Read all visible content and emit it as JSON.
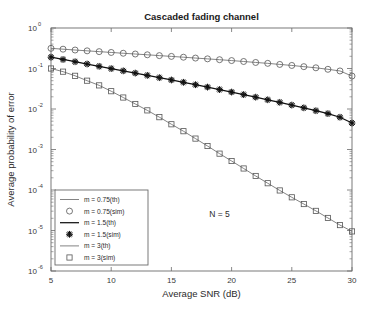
{
  "chart_data": {
    "type": "line",
    "title": "Cascaded fading channel",
    "xlabel": "Average SNR (dB)",
    "ylabel": "Average probability of error",
    "yscale": "log",
    "xlim": [
      5,
      30
    ],
    "ylim": [
      1e-06,
      1
    ],
    "xticks": [
      5,
      10,
      15,
      20,
      25,
      30
    ],
    "xticklabels": [
      "5",
      "10",
      "15",
      "20",
      "25",
      "30"
    ],
    "yticks": [
      1,
      0.1,
      0.01,
      0.001,
      0.0001,
      1e-05,
      1e-06
    ],
    "yticklabels": [
      "10",
      "10",
      "10",
      "10",
      "10",
      "10",
      "10"
    ],
    "yticksuperscripts": [
      "0",
      "-1",
      "-2",
      "-3",
      "-4",
      "-5",
      "-6"
    ],
    "grid": false,
    "legend_position": "lower-left",
    "annotations": [
      {
        "text": "N = 5",
        "x": 19.0,
        "y": 2.2e-05
      }
    ],
    "x": [
      5,
      6,
      7,
      8,
      9,
      10,
      11,
      12,
      13,
      14,
      15,
      16,
      17,
      18,
      19,
      20,
      21,
      22,
      23,
      24,
      25,
      26,
      27,
      28,
      29,
      30
    ],
    "series": [
      {
        "name": "m = 0.75(th)",
        "style": "line",
        "marker": "none",
        "color": "#6e6e6e",
        "values": [
          0.315,
          0.3,
          0.286,
          0.273,
          0.261,
          0.249,
          0.238,
          0.228,
          0.218,
          0.208,
          0.199,
          0.19,
          0.181,
          0.173,
          0.165,
          0.157,
          0.149,
          0.141,
          0.134,
          0.126,
          0.119,
          0.111,
          0.104,
          0.0955,
          0.087,
          0.065
        ]
      },
      {
        "name": "m = 0.75(sim)",
        "style": "marker",
        "marker": "circle",
        "color": "#555555",
        "values": [
          0.315,
          0.3,
          0.286,
          0.273,
          0.261,
          0.249,
          0.238,
          0.228,
          0.218,
          0.208,
          0.199,
          0.19,
          0.181,
          0.173,
          0.165,
          0.157,
          0.149,
          0.141,
          0.134,
          0.126,
          0.119,
          0.111,
          0.104,
          0.0955,
          0.087,
          0.065
        ]
      },
      {
        "name": "m = 1.5(th)",
        "style": "line",
        "marker": "none",
        "color": "#111111",
        "values": [
          0.19,
          0.167,
          0.147,
          0.129,
          0.113,
          0.0995,
          0.0875,
          0.077,
          0.0676,
          0.0594,
          0.0521,
          0.0456,
          0.0398,
          0.0347,
          0.0302,
          0.0262,
          0.0227,
          0.0196,
          0.0169,
          0.0146,
          0.0125,
          0.0107,
          0.00908,
          0.0077,
          0.00626,
          0.0045
        ]
      },
      {
        "name": "m = 1.5(sim)",
        "style": "marker",
        "marker": "star",
        "color": "#111111",
        "values": [
          0.19,
          0.167,
          0.147,
          0.129,
          0.113,
          0.0995,
          0.0875,
          0.077,
          0.0676,
          0.0594,
          0.0521,
          0.0456,
          0.0398,
          0.0347,
          0.0302,
          0.0262,
          0.0227,
          0.0196,
          0.0169,
          0.0146,
          0.0125,
          0.0107,
          0.00908,
          0.0077,
          0.00626,
          0.0045
        ]
      },
      {
        "name": "m = 3(th)",
        "style": "line",
        "marker": "none",
        "color": "#6e6e6e",
        "values": [
          0.1,
          0.0835,
          0.066,
          0.05,
          0.0383,
          0.0275,
          0.0192,
          0.0133,
          0.00925,
          0.00628,
          0.0042,
          0.00283,
          0.00186,
          0.00122,
          0.00079,
          0.00052,
          0.00034,
          0.000222,
          0.000147,
          9.75e-05,
          6.6e-05,
          4.5e-05,
          3.05e-05,
          2.04e-05,
          1.36e-05,
          9.5e-06
        ]
      },
      {
        "name": "m = 3(sim)",
        "style": "marker",
        "marker": "square",
        "color": "#555555",
        "values": [
          0.1,
          0.0835,
          0.066,
          0.05,
          0.0383,
          0.0275,
          0.0192,
          0.0133,
          0.00925,
          0.00628,
          0.0042,
          0.00283,
          0.00186,
          0.00122,
          0.00079,
          0.00052,
          0.00034,
          0.000222,
          0.000147,
          9.75e-05,
          6.6e-05,
          4.5e-05,
          3.05e-05,
          2.04e-05,
          1.36e-05,
          9.5e-06
        ]
      }
    ],
    "legend": [
      {
        "label": "m = 0.75(th)",
        "kind": "line",
        "marker": "none",
        "color": "#6e6e6e"
      },
      {
        "label": "m = 0.75(sim)",
        "kind": "marker",
        "marker": "circle",
        "color": "#555555"
      },
      {
        "label": "m = 1.5(th)",
        "kind": "line",
        "marker": "none",
        "color": "#111111"
      },
      {
        "label": "m = 1.5(sim)",
        "kind": "marker",
        "marker": "star",
        "color": "#111111"
      },
      {
        "label": "m = 3(th)",
        "kind": "line",
        "marker": "none",
        "color": "#6e6e6e"
      },
      {
        "label": "m = 3(sim)",
        "kind": "marker",
        "marker": "square",
        "color": "#555555"
      }
    ]
  },
  "colors": {
    "background": "#ffffff",
    "axis": "#6b6b6b",
    "text": "#2b2b2b",
    "legend_border": "#6b6b6b"
  }
}
